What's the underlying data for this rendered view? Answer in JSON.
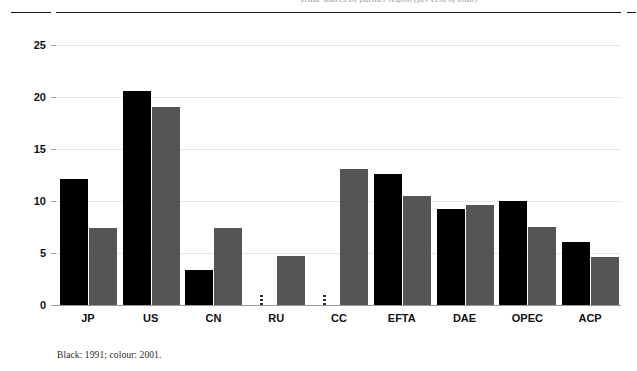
{
  "page": {
    "running_head": "Trade shares by partner region (per cent of total)"
  },
  "caption": "Black: 1991; colour: 2001.",
  "colors": {
    "series_1991": "#000000",
    "series_2001": "#555555",
    "gridline": "#e6e6e6",
    "axis": "#9a9a9a"
  },
  "chart_data": {
    "type": "bar",
    "title": "",
    "subtitle": "",
    "xlabel": "",
    "ylabel": "",
    "ylim": [
      0,
      25
    ],
    "yticks": [
      0,
      5,
      10,
      15,
      20,
      25
    ],
    "ytick_labels": [
      "0",
      "5",
      "10",
      "15",
      "20",
      "25"
    ],
    "grid": true,
    "legend_position": "none",
    "categories": [
      "JP",
      "US",
      "CN",
      "RU",
      "CC",
      "EFTA",
      "DAE",
      "OPEC",
      "ACP"
    ],
    "series": [
      {
        "name": "1991",
        "color": "#000000",
        "values": [
          12.1,
          20.6,
          3.4,
          0.1,
          0.1,
          12.6,
          9.2,
          10.0,
          6.1
        ]
      },
      {
        "name": "2001",
        "color": "#555555",
        "values": [
          7.4,
          19.0,
          7.4,
          4.7,
          13.1,
          10.5,
          9.6,
          7.5,
          4.6
        ]
      }
    ],
    "annotations": [
      "RU and CC 1991 bars are effectively zero (rendered as a thin marker)."
    ]
  }
}
